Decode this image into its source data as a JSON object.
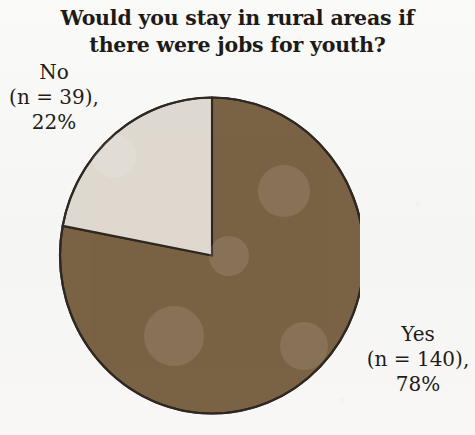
{
  "chart_data": {
    "type": "pie",
    "title": "Would you stay in rural areas if there were jobs for youth?",
    "title_lines": [
      "Would you stay in rural areas if",
      "there were jobs for youth?"
    ],
    "categories": [
      "Yes",
      "No"
    ],
    "values": [
      78,
      22
    ],
    "counts": [
      140,
      39
    ],
    "total_n": 179,
    "units": "percent",
    "start_angle_deg": 0,
    "direction": "clockwise",
    "legend": "none",
    "grid": false,
    "xlabel": "",
    "ylabel": "",
    "slices": [
      {
        "name": "Yes",
        "label_lines": [
          "Yes",
          "(n = 140),",
          "78%"
        ],
        "value": 78,
        "count": 140,
        "percent_text": "78%",
        "count_text": "(n = 140),",
        "color": "#7a6245",
        "sweep_deg": 280.8
      },
      {
        "name": "No",
        "label_lines": [
          "No",
          "(n = 39),",
          "22%"
        ],
        "value": 22,
        "count": 39,
        "percent_text": "22%",
        "count_text": "(n = 39),",
        "color": "#ded9d0",
        "sweep_deg": 79.2
      }
    ],
    "colors": {
      "yes_slice": "#7a6245",
      "no_slice": "#ded9d0",
      "outline": "#2f2822",
      "background": "#f7f7f6",
      "text": "#1d1a17"
    }
  }
}
